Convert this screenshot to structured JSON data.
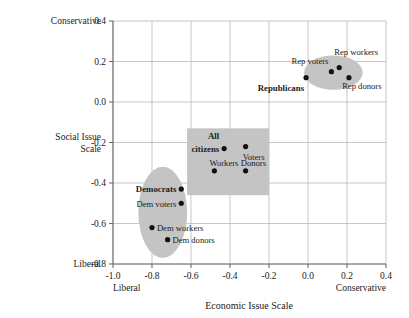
{
  "chart_data": {
    "type": "scatter",
    "title": "",
    "xlabel": "Economic Issue Scale",
    "ylabel": "Social Issue Scale",
    "xlim": [
      -1.0,
      0.4
    ],
    "ylim": [
      -0.8,
      0.4
    ],
    "xticks": [
      "-1.0",
      "-0.8",
      "-0.6",
      "-0.4",
      "-0.2",
      "0.0",
      "0.2",
      "0.4"
    ],
    "yticks": [
      "0.4",
      "0.2",
      "0.0",
      "-0.2",
      "-0.4",
      "-0.6",
      "-0.8"
    ],
    "xtick_values": [
      -1.0,
      -0.8,
      -0.6,
      -0.4,
      -0.2,
      0.0,
      0.2,
      0.4
    ],
    "ytick_values": [
      0.4,
      0.2,
      0.0,
      -0.2,
      -0.4,
      -0.6,
      -0.8
    ],
    "grid": true,
    "legend": "none",
    "x_axis_end_labels": {
      "low": "Liberal",
      "high": "Conservative"
    },
    "y_axis_end_labels": {
      "low": "Liberal",
      "high": "Conservative"
    },
    "point_color": "#111111",
    "cluster_fill": "#c4c4c4",
    "grid_color": "#b9b9b9",
    "axis_color": "#6e6e6e",
    "points": [
      {
        "label": "Republicans",
        "x": -0.01,
        "y": 0.12,
        "bold": true,
        "lx": -0.02,
        "ly": 0.055,
        "anchor": "end"
      },
      {
        "label": "Rep voters",
        "x": 0.12,
        "y": 0.15,
        "bold": false,
        "lx": 0.105,
        "ly": 0.187,
        "anchor": "end"
      },
      {
        "label": "Rep workers",
        "x": 0.16,
        "y": 0.17,
        "bold": false,
        "lx": 0.135,
        "ly": 0.232,
        "anchor": "start"
      },
      {
        "label": "Rep donors",
        "x": 0.21,
        "y": 0.12,
        "bold": false,
        "lx": 0.175,
        "ly": 0.062,
        "anchor": "start"
      },
      {
        "label": "All",
        "x": null,
        "y": null,
        "bold": true,
        "lx": -0.455,
        "ly": -0.185,
        "anchor": "end"
      },
      {
        "label": "citizens",
        "x": -0.43,
        "y": -0.23,
        "bold": true,
        "lx": -0.455,
        "ly": -0.245,
        "anchor": "end"
      },
      {
        "label": "Voters",
        "x": -0.32,
        "y": -0.22,
        "bold": false,
        "lx": -0.335,
        "ly": -0.285,
        "anchor": "start"
      },
      {
        "label": "Workers",
        "x": -0.48,
        "y": -0.34,
        "bold": false,
        "lx": -0.505,
        "ly": -0.318,
        "anchor": "start"
      },
      {
        "label": "Donors",
        "x": -0.32,
        "y": -0.34,
        "bold": false,
        "lx": -0.345,
        "ly": -0.318,
        "anchor": "start"
      },
      {
        "label": "Democrats",
        "x": -0.65,
        "y": -0.43,
        "bold": true,
        "lx": -0.675,
        "ly": -0.445,
        "anchor": "end"
      },
      {
        "label": "Dem voters",
        "x": -0.65,
        "y": -0.5,
        "bold": false,
        "lx": -0.675,
        "ly": -0.517,
        "anchor": "end"
      },
      {
        "label": "Dem workers",
        "x": -0.8,
        "y": -0.62,
        "bold": false,
        "lx": -0.775,
        "ly": -0.638,
        "anchor": "start"
      },
      {
        "label": "Dem donors",
        "x": -0.72,
        "y": -0.68,
        "bold": false,
        "lx": -0.695,
        "ly": -0.697,
        "anchor": "start"
      }
    ],
    "clusters": [
      {
        "name": "republican-cluster",
        "shape": "ellipse",
        "cx": 0.13,
        "cy": 0.145,
        "rx": 0.15,
        "ry": 0.085
      },
      {
        "name": "all-citizens-cluster",
        "shape": "rect",
        "x0": -0.62,
        "y0": -0.13,
        "x1": -0.2,
        "y1": -0.46
      },
      {
        "name": "democrat-cluster",
        "shape": "ellipse",
        "cx": -0.745,
        "cy": -0.545,
        "rx": 0.125,
        "ry": 0.225
      }
    ]
  },
  "labels": {
    "x_title": "Economic Issue Scale",
    "y_title_line1": "Social Issue",
    "y_title_line2": "Scale",
    "y_top": "Conservative",
    "y_bottom": "Liberal",
    "x_left": "Liberal",
    "x_right": "Conservative"
  }
}
